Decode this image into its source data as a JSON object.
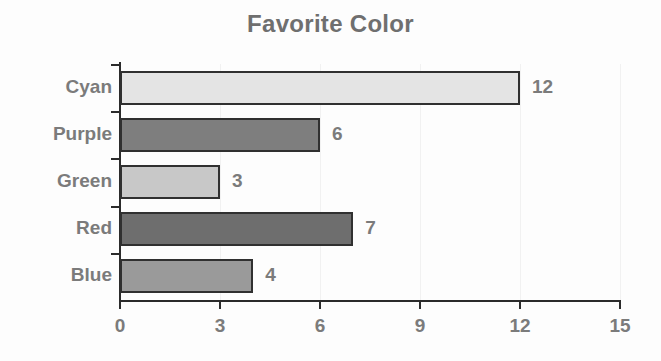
{
  "chart_data": {
    "type": "bar",
    "orientation": "horizontal",
    "title": "Favorite Color",
    "xlabel": "",
    "ylabel": "",
    "categories": [
      "Cyan",
      "Purple",
      "Green",
      "Red",
      "Blue"
    ],
    "values": [
      12,
      6,
      3,
      7,
      4
    ],
    "data_labels": [
      "12",
      "6",
      "3",
      "7",
      "4"
    ],
    "bar_colors": [
      "#e4e4e4",
      "#7e7e7e",
      "#c8c8c8",
      "#6e6e6e",
      "#9a9a9a"
    ],
    "bar_border_color": "#303030",
    "xlim": [
      0,
      15
    ],
    "xticks": [
      0,
      3,
      6,
      9,
      12,
      15
    ],
    "xtick_labels": [
      "0",
      "3",
      "6",
      "9",
      "12",
      "15"
    ],
    "grid": true,
    "legend": "none",
    "title_color": "#6f6f6f",
    "tick_label_color": "#7b7b7b",
    "axis_color": "#2b2b2b",
    "background_color": "#fdfdfd"
  }
}
